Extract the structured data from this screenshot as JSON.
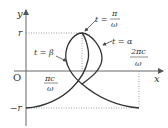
{
  "diagram": {
    "axes": {
      "x_label": "x",
      "y_label": "y",
      "origin_label": "O"
    },
    "y_ticks": {
      "top": "r",
      "bottom": "−r"
    },
    "x_ticks": {
      "first_num": "πc",
      "first_den": "ω",
      "second_num": "2πc",
      "second_den": "ω"
    },
    "annotations": {
      "t_pi_lhs": "t =",
      "t_pi_num": "π",
      "t_pi_den": "ω",
      "t_alpha": "t = α",
      "t_beta": "t = β"
    },
    "colors": {
      "curve": "#333333",
      "axes": "#555555",
      "guide": "#888888"
    }
  }
}
